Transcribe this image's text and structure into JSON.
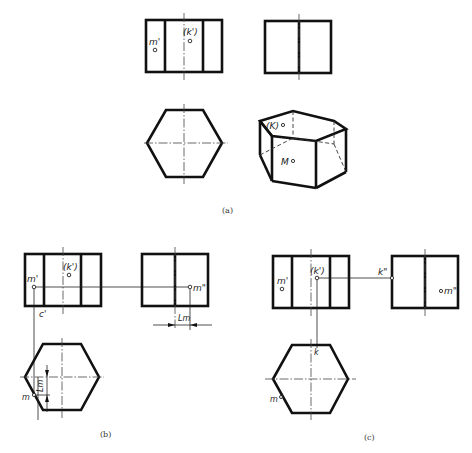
{
  "figure": {
    "captions": {
      "a": "(a)",
      "b": "(b)",
      "c": "(c)"
    },
    "panel_a": {
      "front_view": {
        "labels": {
          "m_prime": "m'",
          "k_prime": "(k')"
        }
      },
      "side_view": {},
      "top_view": {},
      "axonometric": {
        "labels": {
          "K": "(K)",
          "M": "M"
        }
      }
    },
    "panel_b": {
      "front_view": {
        "labels": {
          "m_prime": "m'",
          "k_prime": "(k')",
          "c_prime": "c'"
        }
      },
      "side_view": {
        "labels": {
          "m_double_prime": "m\"",
          "dimension": "Lm"
        }
      },
      "top_view": {
        "labels": {
          "m": "m",
          "dimension": "Lm"
        }
      }
    },
    "panel_c": {
      "front_view": {
        "labels": {
          "m_prime": "m'",
          "k_prime": "(k')"
        }
      },
      "side_view": {
        "labels": {
          "k_double_prime": "k\"",
          "m_double_prime": "m\""
        }
      },
      "top_view": {
        "labels": {
          "m": "m",
          "k": "k"
        }
      }
    }
  }
}
